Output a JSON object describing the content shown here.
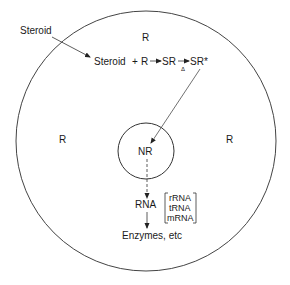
{
  "diagram": {
    "labels": {
      "steroid_outside": "Steroid",
      "reaction_steroid": "Steroid",
      "reaction_plus": "+",
      "reaction_R": "R",
      "reaction_SR": "SR",
      "reaction_delta": "Δ",
      "reaction_SRstar": "SR*",
      "receptor_top": "R",
      "receptor_left": "R",
      "receptor_right": "R",
      "nucleus_receptor": "NR",
      "rna": "RNA",
      "rna_type_1": "rRNA",
      "rna_type_2": "tRNA",
      "rna_type_3": "mRNA",
      "enzymes": "Enzymes, etc"
    },
    "colors": {
      "stroke": "#333333",
      "text": "#1a1a1a",
      "background": "#ffffff"
    }
  }
}
